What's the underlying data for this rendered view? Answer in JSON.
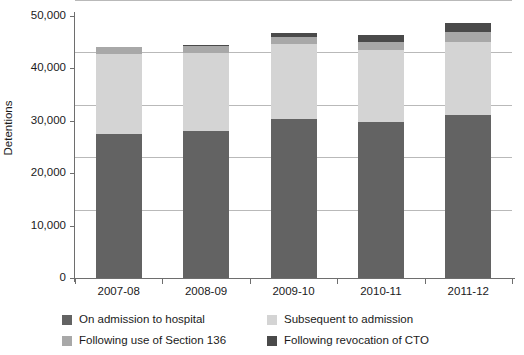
{
  "chart_data": {
    "type": "bar",
    "subtype": "stacked-bar",
    "title": "",
    "xlabel": "",
    "ylabel": "Detentions",
    "ylim": [
      0,
      50000
    ],
    "ytick_values": [
      0,
      10000,
      20000,
      30000,
      40000,
      50000
    ],
    "ytick_labels": [
      "0",
      "10,000",
      "20,000",
      "30,000",
      "40,000",
      "50,000"
    ],
    "grid": true,
    "grid_axis": "y",
    "legend_position": "bottom",
    "categories": [
      "2007-08",
      "2008-09",
      "2009-10",
      "2010-11",
      "2011-12"
    ],
    "series": [
      {
        "name": "On admission to hospital",
        "color": "#636363",
        "values": [
          27500,
          28100,
          30300,
          29700,
          31100
        ]
      },
      {
        "name": "Subsequent to admission",
        "color": "#d4d4d4",
        "values": [
          15300,
          14900,
          14300,
          13800,
          13900
        ]
      },
      {
        "name": "Following use of Section 136",
        "color": "#a8a8a8",
        "values": [
          1200,
          1300,
          1300,
          1600,
          1900
        ]
      },
      {
        "name": "Following revocation of CTO",
        "color": "#4a4a4a",
        "values": [
          0,
          200,
          800,
          1300,
          1700
        ]
      }
    ],
    "totals": [
      44000,
      44500,
      46700,
      46400,
      48600
    ]
  },
  "legend": {
    "entries": [
      {
        "label": "On admission to hospital",
        "color": "#636363",
        "swatch_name": "legend-swatch-on-admission"
      },
      {
        "label": "Subsequent to admission",
        "color": "#d4d4d4",
        "swatch_name": "legend-swatch-subsequent"
      },
      {
        "label": "Following use of Section 136",
        "color": "#a8a8a8",
        "swatch_name": "legend-swatch-section-136"
      },
      {
        "label": "Following revocation of CTO",
        "color": "#4a4a4a",
        "swatch_name": "legend-swatch-cto"
      }
    ]
  },
  "axes": {
    "y_title": "Detentions"
  }
}
